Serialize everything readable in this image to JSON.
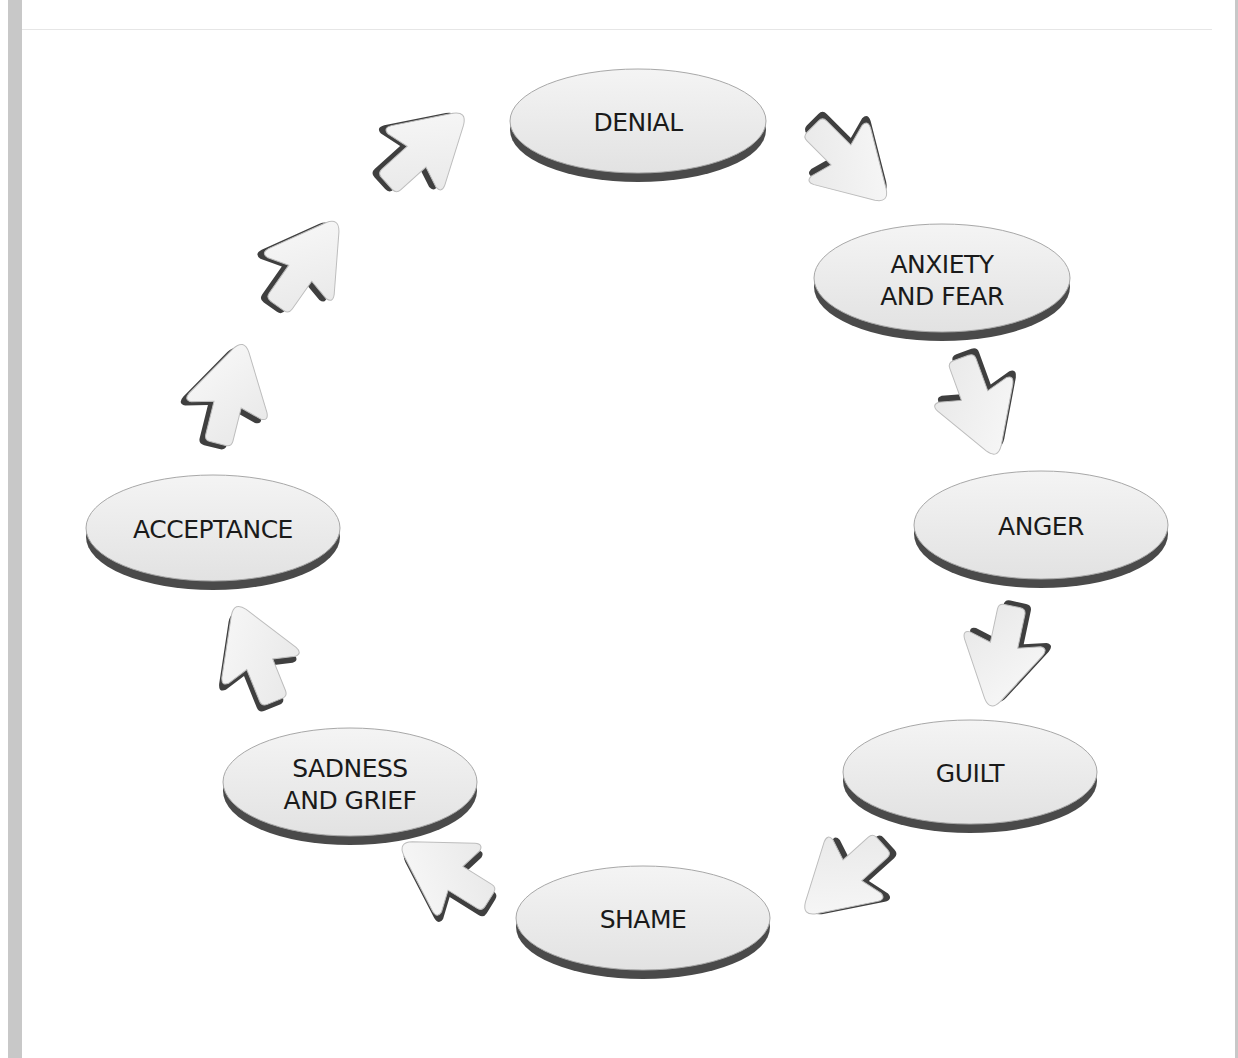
{
  "diagram": {
    "type": "cycle",
    "colors": {
      "node_fill": "#ececec",
      "node_shadow": "#555555",
      "arrow_fill": "#f0f0f0",
      "arrow_shadow": "#444444",
      "text": "#1a1a1a",
      "side_bar": "#c8c8c8"
    },
    "nodes": [
      {
        "id": "denial",
        "lines": [
          "DENIAL"
        ]
      },
      {
        "id": "anxiety",
        "lines": [
          "ANXIETY",
          "AND FEAR"
        ]
      },
      {
        "id": "anger",
        "lines": [
          "ANGER"
        ]
      },
      {
        "id": "guilt",
        "lines": [
          "GUILT"
        ]
      },
      {
        "id": "shame",
        "lines": [
          "SHAME"
        ]
      },
      {
        "id": "sadness",
        "lines": [
          "SADNESS",
          "AND GRIEF"
        ]
      },
      {
        "id": "acceptance",
        "lines": [
          "ACCEPTANCE"
        ]
      }
    ],
    "edges": [
      {
        "from": "denial",
        "to": "anxiety",
        "arrows": 1
      },
      {
        "from": "anxiety",
        "to": "anger",
        "arrows": 1
      },
      {
        "from": "anger",
        "to": "guilt",
        "arrows": 1
      },
      {
        "from": "guilt",
        "to": "shame",
        "arrows": 1
      },
      {
        "from": "shame",
        "to": "sadness",
        "arrows": 1
      },
      {
        "from": "sadness",
        "to": "acceptance",
        "arrows": 1
      },
      {
        "from": "acceptance",
        "to": "denial",
        "arrows": 3
      }
    ]
  }
}
